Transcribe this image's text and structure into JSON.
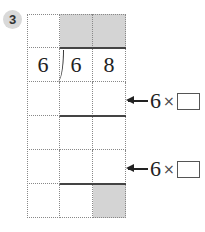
{
  "problem": {
    "number": "3"
  },
  "division": {
    "divisor": "6",
    "dividend_digits": [
      "6",
      "8"
    ]
  },
  "steps": [
    {
      "prefix": "6",
      "operator": "×",
      "answer_box": ""
    },
    {
      "prefix": "6",
      "operator": "×",
      "answer_box": ""
    }
  ],
  "colors": {
    "shade": "#d4d4d4",
    "badge": "#d9d9d9"
  }
}
